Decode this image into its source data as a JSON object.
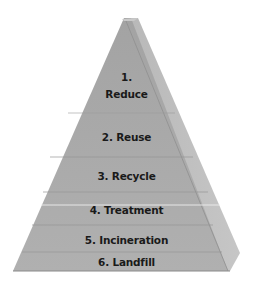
{
  "diagram": {
    "type": "pyramid",
    "colors": {
      "front_face": "#a9a9a9",
      "right_face": "#bdbdbd",
      "divider": "#9a9a9a",
      "highlight_divider": "#e8e8e8",
      "text": "#1a1a1a"
    },
    "levels": [
      {
        "number": "1.",
        "name": "Reduce",
        "label_line1": "1.",
        "label_line2": "Reduce"
      },
      {
        "number": "2.",
        "name": "Reuse",
        "label": "2. Reuse"
      },
      {
        "number": "3.",
        "name": "Recycle",
        "label": "3. Recycle"
      },
      {
        "number": "4.",
        "name": "Treatment",
        "label": "4. Treatment"
      },
      {
        "number": "5.",
        "name": "Incineration",
        "label": "5. Incineration"
      },
      {
        "number": "6.",
        "name": "Landfill",
        "label": "6. Landfill"
      }
    ]
  }
}
